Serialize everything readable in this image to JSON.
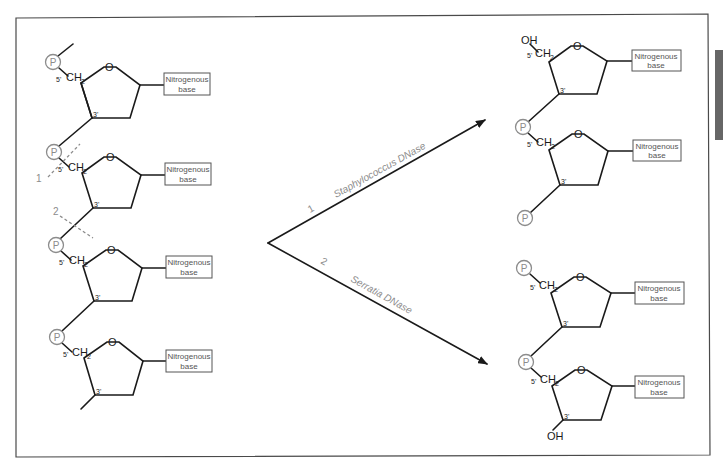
{
  "diagram": {
    "labels": {
      "phosphate": "P",
      "ring_oxygen": "O",
      "ch2": "CH",
      "ch2_sub": "2",
      "five_prime": "5'",
      "three_prime": "3'",
      "hydroxyl": "OH",
      "base_line1": "Nitrogenous",
      "base_line2": "base"
    },
    "cut_sites": [
      {
        "id": "1",
        "label": "1"
      },
      {
        "id": "2",
        "label": "2"
      }
    ],
    "pathways": [
      {
        "number": "1",
        "enzyme": "Staphylococcus DNase"
      },
      {
        "number": "2",
        "enzyme": "Serratia DNase"
      }
    ],
    "colors": {
      "bond": "#1a1a1a",
      "phosphate_circle": "#8c8c8c",
      "annotation": "#8c8c8c",
      "frame": "#4a4a4a",
      "side_tab": "#666666"
    }
  }
}
